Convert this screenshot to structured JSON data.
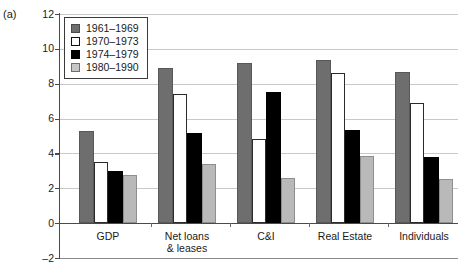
{
  "panel": {
    "label": "(a)"
  },
  "chart_data": {
    "type": "bar",
    "title": "",
    "subtitle": "",
    "xlabel": "",
    "ylabel": "",
    "ylim": [
      -2,
      12
    ],
    "yticks": [
      12,
      10,
      8,
      6,
      4,
      2,
      0,
      -2
    ],
    "grid": true,
    "legend_position": "top-left",
    "categories": [
      "GDP",
      "Net loans\n& leases",
      "C&I",
      "Real Estate",
      "Individuals"
    ],
    "category_labels": [
      {
        "line1": "GDP",
        "line2": ""
      },
      {
        "line1": "Net loans",
        "line2": "& leases"
      },
      {
        "line1": "C&I",
        "line2": ""
      },
      {
        "line1": "Real Estate",
        "line2": ""
      },
      {
        "line1": "Individuals",
        "line2": ""
      }
    ],
    "series": [
      {
        "name": "1961–1969",
        "color": "#6e6e6e",
        "values": [
          5.3,
          8.9,
          9.2,
          9.35,
          8.7
        ]
      },
      {
        "name": "1970–1973",
        "color": "#ffffff",
        "values": [
          3.5,
          7.4,
          4.85,
          8.6,
          6.9
        ]
      },
      {
        "name": "1974–1979",
        "color": "#000000",
        "values": [
          3.0,
          5.2,
          7.5,
          5.35,
          3.8
        ]
      },
      {
        "name": "1980–1990",
        "color": "#b9b9b9",
        "values": [
          2.75,
          3.4,
          2.6,
          3.85,
          2.55
        ]
      }
    ]
  }
}
